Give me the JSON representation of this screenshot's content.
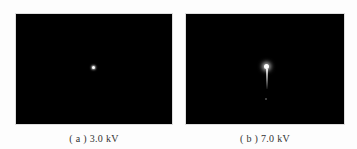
{
  "figure": {
    "panels": [
      {
        "id": "a",
        "caption": "( a ) 3.0 kV",
        "description": "black field with single small bright point at center"
      },
      {
        "id": "b",
        "caption": "( b ) 7.0 kV",
        "description": "black field with bright point, vertical streak below, faint dot further down"
      }
    ],
    "colors": {
      "background": "#fdfdfd",
      "panel": "#000000",
      "spot": "#ffffff"
    }
  }
}
